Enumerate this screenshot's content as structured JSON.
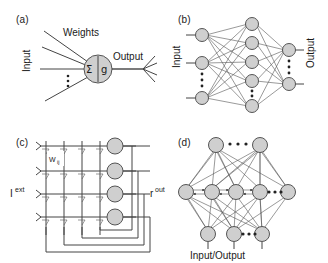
{
  "figure": {
    "kind": "multi-panel-neural-network-diagram",
    "background": "#ffffff",
    "node_fill": "#cfcfcf",
    "node_stroke": "#555555",
    "line_color": "#444444",
    "text_color": "#1a1a1a"
  },
  "panel_a": {
    "label": "(a)",
    "title": "single artificial neuron",
    "weights_label": "Weights",
    "input_label": "Input",
    "output_label": "Output",
    "sum_symbol": "Σ",
    "activation_symbol": "g",
    "ellipsis": "⋮",
    "input_line_count": 4
  },
  "panel_b": {
    "label": "(b)",
    "title": "feedforward network",
    "input_label": "Input",
    "output_label": "Output",
    "ellipsis": "⋮",
    "layers": [
      {
        "name": "input",
        "visible_nodes": 3,
        "has_ellipsis": true
      },
      {
        "name": "hidden",
        "visible_nodes": 5,
        "has_ellipsis": true
      },
      {
        "name": "output",
        "visible_nodes": 2,
        "has_ellipsis": true
      }
    ]
  },
  "panel_c": {
    "label": "(c)",
    "title": "crossbar array implementation",
    "weight_label": "W",
    "weight_sub": "ij",
    "input_label": "I",
    "input_sup": "ext",
    "output_label": "r",
    "output_sup": "out",
    "rows": 4,
    "columns": 4,
    "neuron_count": 4,
    "junction_symbol": "resistor-glyph"
  },
  "panel_d": {
    "label": "(d)",
    "title": "recurrent network",
    "io_label": "Input/Output",
    "ellipsis": "•••",
    "rows": [
      {
        "name": "top",
        "visible_nodes": 2,
        "has_ellipsis": true
      },
      {
        "name": "middle",
        "visible_nodes": 5,
        "has_ellipsis": true
      },
      {
        "name": "bottom",
        "visible_nodes": 3,
        "has_ellipsis": true
      }
    ]
  }
}
